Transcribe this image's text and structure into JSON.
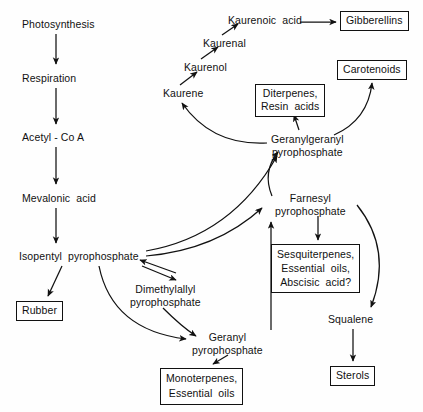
{
  "diagram": {
    "background_color": "#fefefe",
    "stroke_color": "#111111",
    "nodes": [
      {
        "id": "photosynthesis",
        "label": "Photosynthesis",
        "lines": [
          "Photosynthesis"
        ],
        "boxed": false,
        "x": 22,
        "y": 18
      },
      {
        "id": "respiration",
        "label": "Respiration",
        "lines": [
          "Respiration"
        ],
        "boxed": false,
        "x": 22,
        "y": 72
      },
      {
        "id": "acetyl-coa",
        "label": "Acetyl - Co A",
        "lines": [
          "Acetyl - Co A"
        ],
        "boxed": false,
        "x": 22,
        "y": 131
      },
      {
        "id": "mevalonic-acid",
        "label": "Mevalonic  acid",
        "lines": [
          "Mevalonic  acid"
        ],
        "boxed": false,
        "x": 22,
        "y": 192
      },
      {
        "id": "isopentyl-pyrophosphate",
        "label": "Isopentyl  pyrophosphate",
        "lines": [
          "Isopentyl  pyrophosphate"
        ],
        "boxed": false,
        "x": 19,
        "y": 250
      },
      {
        "id": "rubber",
        "label": "Rubber",
        "lines": [
          "Rubber"
        ],
        "boxed": true,
        "x": 16,
        "y": 301
      },
      {
        "id": "dimethylallyl-pyrophosphate",
        "label": "Dimethylallyl pyrophosphate",
        "lines": [
          "Dimethylallyl",
          "pyrophosphate"
        ],
        "boxed": false,
        "x": 130,
        "y": 283
      },
      {
        "id": "geranyl-pyrophosphate",
        "label": "Geranyl pyrophosphate",
        "lines": [
          "Geranyl",
          "pyrophosphate"
        ],
        "boxed": false,
        "x": 192,
        "y": 331
      },
      {
        "id": "monoterpenes-essential-oils",
        "label": "Monoterpenes, Essential oils",
        "lines": [
          "Monoterpenes,",
          "Essential  oils"
        ],
        "boxed": true,
        "x": 160,
        "y": 368
      },
      {
        "id": "kaurene",
        "label": "Kaurene",
        "lines": [
          "Kaurene"
        ],
        "boxed": false,
        "x": 163,
        "y": 87
      },
      {
        "id": "kaurenol",
        "label": "Kaurenol",
        "lines": [
          "Kaurenol"
        ],
        "boxed": false,
        "x": 184,
        "y": 61
      },
      {
        "id": "kaurenal",
        "label": "Kaurenal",
        "lines": [
          "Kaurenal"
        ],
        "boxed": false,
        "x": 203,
        "y": 37
      },
      {
        "id": "kaurenoic-acid",
        "label": "Kaurenoic  acid",
        "lines": [
          "Kaurenoic  acid"
        ],
        "boxed": false,
        "x": 228,
        "y": 14
      },
      {
        "id": "gibberellins",
        "label": "Gibberellins",
        "lines": [
          "Gibberellins"
        ],
        "boxed": true,
        "x": 340,
        "y": 11
      },
      {
        "id": "carotenoids",
        "label": "Carotenoids",
        "lines": [
          "Carotenoids"
        ],
        "boxed": true,
        "x": 337,
        "y": 60
      },
      {
        "id": "diterpenes-resin-acids",
        "label": "Diterpenes, Resin acids",
        "lines": [
          "Diterpenes,",
          "Resin  acids"
        ],
        "boxed": true,
        "x": 255,
        "y": 84
      },
      {
        "id": "geranylgeranyl-pyrophosphate",
        "label": "Geranylgeranyl pyrophosphate",
        "lines": [
          "Geranylgeranyl",
          "pyrophosphate"
        ],
        "boxed": false,
        "x": 271,
        "y": 133
      },
      {
        "id": "farnesyl-pyrophosphate",
        "label": "Farnesyl pyrophosphate",
        "lines": [
          "Farnesyl",
          "pyrophosphate"
        ],
        "boxed": false,
        "x": 275,
        "y": 192
      },
      {
        "id": "sesquiterpenes-essential-oils-abscisic-acid",
        "label": "Sesquiterpenes, Essential oils, Abscisic acid?",
        "lines": [
          "Sesquiterpenes,",
          "Essential  oils,",
          "Abscisic  acid?"
        ],
        "boxed": true,
        "x": 271,
        "y": 244
      },
      {
        "id": "squalene",
        "label": "Squalene",
        "lines": [
          "Squalene"
        ],
        "boxed": false,
        "x": 328,
        "y": 313
      },
      {
        "id": "sterols",
        "label": "Sterols",
        "lines": [
          "Sterols"
        ],
        "boxed": true,
        "x": 330,
        "y": 366
      }
    ],
    "edges": [
      {
        "id": "photosynthesis-to-respiration",
        "from": "photosynthesis",
        "to": "respiration",
        "kind": "straight"
      },
      {
        "id": "respiration-to-acetyl-coa",
        "from": "respiration",
        "to": "acetyl-coa",
        "kind": "straight"
      },
      {
        "id": "acetyl-coa-to-mevalonic-acid",
        "from": "acetyl-coa",
        "to": "mevalonic-acid",
        "kind": "straight"
      },
      {
        "id": "mevalonic-acid-to-isopentyl-pyrophosphate",
        "from": "mevalonic-acid",
        "to": "isopentyl-pyrophosphate",
        "kind": "straight"
      },
      {
        "id": "isopentyl-to-rubber",
        "from": "isopentyl-pyrophosphate",
        "to": "rubber",
        "kind": "straight"
      },
      {
        "id": "isopentyl-to-dimethylallyl",
        "from": "isopentyl-pyrophosphate",
        "to": "dimethylallyl-pyrophosphate",
        "kind": "straight"
      },
      {
        "id": "dimethylallyl-to-isopentyl",
        "from": "dimethylallyl-pyrophosphate",
        "to": "isopentyl-pyrophosphate",
        "kind": "straight"
      },
      {
        "id": "isopentyl-to-geranyl",
        "from": "isopentyl-pyrophosphate",
        "to": "geranyl-pyrophosphate",
        "kind": "curved"
      },
      {
        "id": "dimethylallyl-to-geranyl",
        "from": "dimethylallyl-pyrophosphate",
        "to": "geranyl-pyrophosphate",
        "kind": "curved"
      },
      {
        "id": "geranyl-to-monoterpenes",
        "from": "geranyl-pyrophosphate",
        "to": "monoterpenes-essential-oils",
        "kind": "straight"
      },
      {
        "id": "geranyl-to-farnesyl",
        "from": "geranyl-pyrophosphate",
        "to": "farnesyl-pyrophosphate",
        "kind": "straight"
      },
      {
        "id": "isopentyl-to-farnesyl",
        "from": "isopentyl-pyrophosphate",
        "to": "farnesyl-pyrophosphate",
        "kind": "curved"
      },
      {
        "id": "isopentyl-to-geranylgeranyl",
        "from": "isopentyl-pyrophosphate",
        "to": "geranylgeranyl-pyrophosphate",
        "kind": "curved"
      },
      {
        "id": "farnesyl-to-geranylgeranyl",
        "from": "farnesyl-pyrophosphate",
        "to": "geranylgeranyl-pyrophosphate",
        "kind": "curved"
      },
      {
        "id": "farnesyl-to-sesquiterpenes",
        "from": "farnesyl-pyrophosphate",
        "to": "sesquiterpenes-essential-oils-abscisic-acid",
        "kind": "straight"
      },
      {
        "id": "farnesyl-to-squalene",
        "from": "farnesyl-pyrophosphate",
        "to": "squalene",
        "kind": "curved"
      },
      {
        "id": "squalene-to-sterols",
        "from": "squalene",
        "to": "sterols",
        "kind": "straight"
      },
      {
        "id": "geranylgeranyl-to-kaurene",
        "from": "geranylgeranyl-pyrophosphate",
        "to": "kaurene",
        "kind": "curved"
      },
      {
        "id": "geranylgeranyl-to-diterpenes",
        "from": "geranylgeranyl-pyrophosphate",
        "to": "diterpenes-resin-acids",
        "kind": "straight"
      },
      {
        "id": "geranylgeranyl-to-carotenoids",
        "from": "geranylgeranyl-pyrophosphate",
        "to": "carotenoids",
        "kind": "curved"
      },
      {
        "id": "kaurene-to-kaurenol",
        "from": "kaurene",
        "to": "kaurenol",
        "kind": "straight"
      },
      {
        "id": "kaurenol-to-kaurenal",
        "from": "kaurenol",
        "to": "kaurenal",
        "kind": "straight"
      },
      {
        "id": "kaurenal-to-kaurenoic-acid",
        "from": "kaurenal",
        "to": "kaurenoic-acid",
        "kind": "straight"
      },
      {
        "id": "kaurenoic-acid-to-gibberellins",
        "from": "kaurenoic-acid",
        "to": "gibberellins",
        "kind": "straight"
      }
    ]
  }
}
